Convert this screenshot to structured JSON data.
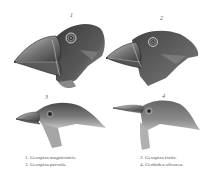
{
  "plate": {
    "subject": "Darwin's finches heads engraving",
    "figures": [
      {
        "number": "1",
        "species": "Geospiza magnirostris."
      },
      {
        "number": "2",
        "species": "Geospiza fortis."
      },
      {
        "number": "3",
        "species": "Geospiza parvula."
      },
      {
        "number": "4",
        "species": "Certhidea olivacea."
      }
    ]
  },
  "captions": {
    "left": [
      "1. Geospiza magnirostris.",
      "3. Geospiza parvula."
    ],
    "right": [
      "2. Geospiza fortis.",
      "4. Certhidea olivacea."
    ]
  },
  "labels": {
    "fig1": "1",
    "fig2": "2",
    "fig3": "3",
    "fig4": "4"
  },
  "colors": {
    "ink_dark": "#2a2a2a",
    "ink_mid": "#6a6a6a",
    "ink_light": "#b5b5b5",
    "paper": "#ffffff"
  }
}
